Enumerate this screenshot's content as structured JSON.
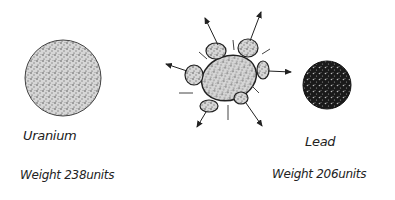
{
  "diagram": {
    "type": "nuclear-decay-illustration",
    "left": {
      "element": "Uranium",
      "weight_label": "Weight 238units",
      "weight_value": 238
    },
    "middle": {
      "description": "Nucleus splitting with fragments flying outward",
      "fragment_count": 8
    },
    "right": {
      "element": "Lead",
      "weight_label": "Weight 206units",
      "weight_value": 206
    }
  }
}
